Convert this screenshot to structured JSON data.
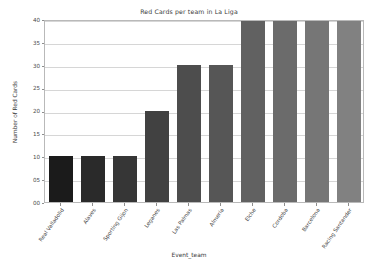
{
  "chart_data": {
    "type": "bar",
    "title": "Red Cards per team in La Liga",
    "xlabel": "Event_team",
    "ylabel": "Number of Red Cards",
    "categories": [
      "Real Valladolid",
      "Alaves",
      "Sporting Gijon",
      "Leganes",
      "Las Palmas",
      "Almeria",
      "Elche",
      "Cordoba",
      "Barcelona",
      "Racing Santander"
    ],
    "values": [
      10,
      10,
      10,
      20,
      30,
      30,
      40,
      40,
      40,
      40
    ],
    "bar_colors": [
      "#1b1b1b",
      "#2a2a2a",
      "#363636",
      "#414141",
      "#4d4d4d",
      "#565656",
      "#616161",
      "#6b6b6b",
      "#767676",
      "#818181"
    ],
    "ylim": [
      0,
      40
    ],
    "yticks": [
      0,
      5,
      10,
      15,
      20,
      25,
      30,
      35,
      40
    ],
    "ytick_labels": [
      "00",
      "05",
      "10",
      "15",
      "20",
      "25",
      "30",
      "35",
      "40"
    ],
    "grid": true,
    "legend": null,
    "xtick_rotation": -55
  }
}
